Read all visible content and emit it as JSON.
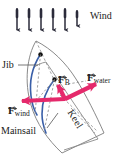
{
  "figure": {
    "width": 123,
    "height": 161,
    "background": "#ffffff"
  },
  "colors": {
    "force_vector": "#E5296B",
    "sail": "#3A5FA8",
    "hull_outline": "#8A8A8A",
    "wind_arrow": "#2B2B3A",
    "text": "#1A1A1A",
    "dashed": "#8A8A8A"
  },
  "labels": {
    "wind": "Wind",
    "jib": "Jib",
    "mainsail": "Mainsail",
    "keel": "Keel"
  },
  "vectors": [
    {
      "id": "f-b",
      "symbol": "F",
      "subscript": "B",
      "name": "resultant-force-on-boat",
      "direction_deg": 65,
      "color": "#E5296B"
    },
    {
      "id": "f-water",
      "symbol": "F",
      "subscript": "water",
      "name": "force-from-water",
      "direction_deg": 20,
      "color": "#E5296B"
    },
    {
      "id": "f-wind",
      "symbol": "F",
      "subscript": "wind",
      "name": "force-from-wind",
      "direction_deg": 185,
      "color": "#E5296B"
    }
  ],
  "wind_arrows": {
    "count": 6,
    "direction": "down",
    "x_positions": [
      17,
      29,
      41,
      53,
      65,
      77
    ],
    "y_top": 8,
    "y_bottom": 31
  }
}
